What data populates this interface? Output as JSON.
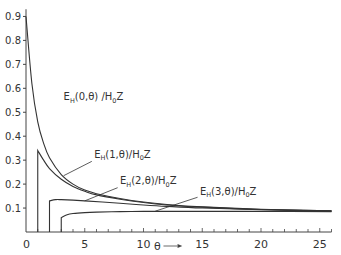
{
  "chart_data": {
    "type": "line",
    "title": "",
    "xlabel": "θ",
    "ylabel": "",
    "xlim": [
      0,
      26
    ],
    "ylim": [
      0,
      0.95
    ],
    "grid": false,
    "x_ticks": [
      "0",
      "5",
      "10",
      "15",
      "20",
      "25"
    ],
    "y_ticks": [
      "0.1",
      "0.2",
      "0.3",
      "0.4",
      "0.5",
      "0.6",
      "0.7",
      "0.8",
      "0.9"
    ],
    "series": [
      {
        "name": "E_H(0,θ)/H_0Z",
        "label_main": "E",
        "label_sub": "H",
        "label_args": "(0,θ) /H",
        "label_sub2": "0",
        "label_tail": "Z",
        "x": [
          0,
          0.5,
          1,
          1.5,
          2,
          3,
          4,
          5,
          6,
          8,
          10,
          12,
          15,
          20,
          26
        ],
        "values": [
          0.9,
          0.62,
          0.46,
          0.37,
          0.31,
          0.24,
          0.2,
          0.175,
          0.16,
          0.14,
          0.125,
          0.115,
          0.105,
          0.095,
          0.088
        ]
      },
      {
        "name": "E_H(1,θ)/H_0Z",
        "label_main": "E",
        "label_sub": "H",
        "label_args": "(1,θ)/H",
        "label_sub2": "0",
        "label_tail": "Z",
        "x": [
          1,
          1,
          1.5,
          2,
          3,
          4,
          5,
          6,
          8,
          10,
          12,
          15,
          20,
          26
        ],
        "values": [
          0,
          0.34,
          0.3,
          0.265,
          0.22,
          0.19,
          0.17,
          0.155,
          0.137,
          0.123,
          0.113,
          0.104,
          0.094,
          0.088
        ]
      },
      {
        "name": "E_H(2,θ)/H_0Z",
        "label_main": "E",
        "label_sub": "H",
        "label_args": "(2,θ)/H",
        "label_sub2": "0",
        "label_tail": "Z",
        "x": [
          2,
          2,
          2.5,
          3,
          5,
          8,
          10,
          12,
          15,
          20,
          26
        ],
        "values": [
          0,
          0.13,
          0.135,
          0.135,
          0.13,
          0.12,
          0.113,
          0.107,
          0.1,
          0.093,
          0.087
        ]
      },
      {
        "name": "E_H(3,θ)/H_0Z",
        "label_main": "E",
        "label_sub": "H",
        "label_args": "(3,θ)/H",
        "label_sub2": "0",
        "label_tail": "Z",
        "x": [
          3,
          3,
          3.5,
          4,
          5,
          6,
          8,
          10,
          12,
          15,
          20,
          26
        ],
        "values": [
          0,
          0.06,
          0.072,
          0.077,
          0.081,
          0.083,
          0.085,
          0.086,
          0.086,
          0.086,
          0.086,
          0.085
        ]
      }
    ],
    "annotations": [
      {
        "series": 0,
        "text": "E_H(0,θ)/H_0Z",
        "x": 3.2,
        "y": 0.55
      },
      {
        "series": 1,
        "text": "E_H(1,θ)/H_0Z",
        "x": 5.8,
        "y": 0.31
      },
      {
        "series": 2,
        "text": "E_H(2,θ)/H_0Z",
        "x": 8.0,
        "y": 0.2
      },
      {
        "series": 3,
        "text": "E_H(3,θ)/H_0Z",
        "x": 14.8,
        "y": 0.155
      }
    ]
  },
  "axis": {
    "x_arrow_label": "θ"
  }
}
